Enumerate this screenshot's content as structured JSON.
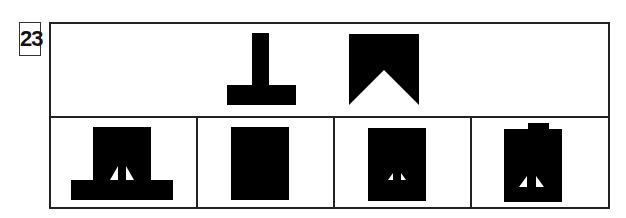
{
  "question": {
    "number": "23"
  },
  "prompt_figures": [
    {
      "id": "inverted-t",
      "description": "inverted T shape: vertical stem on horizontal base"
    },
    {
      "id": "notched-rectangle",
      "description": "rectangle with triangular notch cut from bottom center"
    }
  ],
  "options": [
    {
      "index": 1,
      "description": "wide base with rectangle above, two small white triangles near bottom"
    },
    {
      "index": 2,
      "description": "plain solid black rectangle"
    },
    {
      "index": 3,
      "description": "solid rectangle with two tiny white triangles near bottom"
    },
    {
      "index": 4,
      "description": "rectangle with small tab on top and two white triangles near bottom"
    }
  ],
  "colors": {
    "fill": "#000000",
    "border": "#222222",
    "background": "#ffffff"
  }
}
